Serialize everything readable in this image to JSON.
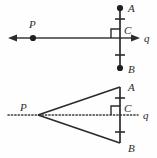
{
  "figure": {
    "background_color": "#fefefe",
    "stroke_color": "#2b2b2b",
    "line_color": "#3a3a3a",
    "panels": [
      {
        "id": "top-panel",
        "description": "Point P on line q with perpendicular segment AB meeting q at C",
        "line_q": {
          "label": "q",
          "style": "solid",
          "left_arrow": true,
          "right_arrow": true,
          "y": 38,
          "x_start": 8,
          "x_end": 140
        },
        "points": [
          {
            "name": "P",
            "label": "P",
            "x": 33,
            "y": 38,
            "label_x": 31,
            "label_y": 27,
            "dot": true
          },
          {
            "name": "A",
            "label": "A",
            "x": 120,
            "y": 8,
            "label_x": 128,
            "label_y": 11,
            "dot": true
          },
          {
            "name": "C",
            "label": "C",
            "x": 120,
            "y": 38,
            "label_x": 126,
            "label_y": 33,
            "dot": false
          },
          {
            "name": "B",
            "label": "B",
            "x": 120,
            "y": 68,
            "label_x": 128,
            "label_y": 72,
            "dot": true
          }
        ],
        "segment_AB": {
          "x": 120,
          "y_top": 8,
          "y_bottom": 68,
          "style": "solid"
        },
        "tick_marks": [
          {
            "name": "tick-AC",
            "x": 120,
            "y": 19,
            "half_width": 5
          },
          {
            "name": "tick-CB",
            "x": 120,
            "y": 55,
            "half_width": 5
          }
        ],
        "right_angle": {
          "x": 120,
          "y": 38,
          "size": 9,
          "corner": "upper-left"
        }
      },
      {
        "id": "bottom-panel",
        "description": "Triangle PAB with P apex on dotted line q, perpendicular bisector at C",
        "line_q": {
          "label": "q",
          "style": "dotted",
          "left_arrow": false,
          "right_arrow": false,
          "y": 115,
          "x_start": 8,
          "x_end": 140
        },
        "points": [
          {
            "name": "P",
            "label": "P",
            "x": 38,
            "y": 115,
            "label_x": 21,
            "label_y": 110,
            "dot": false
          },
          {
            "name": "A",
            "label": "A",
            "x": 120,
            "y": 87,
            "label_x": 128,
            "label_y": 90,
            "dot": false
          },
          {
            "name": "C",
            "label": "C",
            "x": 120,
            "y": 115,
            "label_x": 126,
            "label_y": 111,
            "dot": false
          },
          {
            "name": "B",
            "label": "B",
            "x": 120,
            "y": 143,
            "label_x": 128,
            "label_y": 150,
            "dot": false
          }
        ],
        "segment_AB": {
          "x": 120,
          "y_top": 87,
          "y_bottom": 143,
          "style": "solid"
        },
        "triangle_sides": [
          {
            "name": "side-PA",
            "x1": 38,
            "y1": 115,
            "x2": 120,
            "y2": 87
          },
          {
            "name": "side-PB",
            "x1": 38,
            "y1": 115,
            "x2": 120,
            "y2": 143
          }
        ],
        "tick_marks": [
          {
            "name": "tick-AC",
            "x": 120,
            "y": 98,
            "half_width": 5
          },
          {
            "name": "tick-CB",
            "x": 120,
            "y": 132,
            "half_width": 5
          }
        ],
        "right_angle": {
          "x": 120,
          "y": 115,
          "size": 9,
          "corner": "upper-left"
        }
      }
    ],
    "labels": {
      "P": "P",
      "A": "A",
      "B": "B",
      "C": "C",
      "q": "q"
    }
  }
}
